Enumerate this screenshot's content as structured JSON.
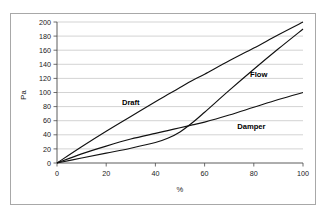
{
  "chart_data": {
    "type": "line",
    "title": "",
    "xlabel": "%",
    "ylabel": "Pa",
    "xlim": [
      0,
      100
    ],
    "ylim": [
      0,
      200
    ],
    "grid": true,
    "legend_position": "inline-labels",
    "x_ticks": [
      0,
      20,
      40,
      60,
      80,
      100
    ],
    "y_ticks": [
      0,
      20,
      40,
      60,
      80,
      100,
      120,
      140,
      160,
      180,
      200
    ],
    "x": [
      0,
      10,
      20,
      30,
      40,
      45,
      50,
      55,
      60,
      70,
      80,
      90,
      100
    ],
    "series": [
      {
        "name": "Draft",
        "values": [
          0,
          23,
          45,
          66,
          87,
          97,
          107,
          117,
          126,
          145,
          163,
          182,
          200
        ],
        "label_x": 30,
        "label_y": 82
      },
      {
        "name": "Flow",
        "values": [
          0,
          7,
          14,
          21,
          29,
          35,
          44,
          57,
          72,
          103,
          133,
          162,
          190
        ],
        "label_x": 82,
        "label_y": 122
      },
      {
        "name": "Damper",
        "values": [
          0,
          13,
          24,
          34,
          42,
          46,
          50,
          54,
          58,
          68,
          79,
          90,
          100
        ],
        "label_x": 79,
        "label_y": 48
      }
    ]
  },
  "figure": {
    "ylabel": "Pa",
    "xlabel": "%",
    "ytick_labels": [
      "200",
      "180",
      "160",
      "140",
      "120",
      "100",
      "80",
      "60",
      "40",
      "20",
      "0"
    ],
    "xtick_labels": [
      "0",
      "20",
      "40",
      "60",
      "80",
      "100"
    ],
    "series_labels": [
      "Draft",
      "Flow",
      "Damper"
    ]
  }
}
